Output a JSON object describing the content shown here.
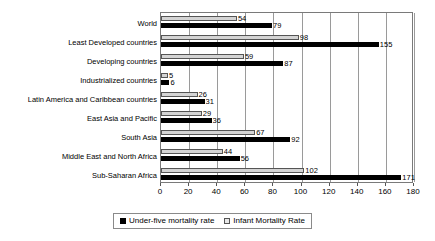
{
  "chart_data": {
    "type": "bar",
    "orientation": "horizontal",
    "title": "",
    "xlabel": "",
    "ylabel": "",
    "xlim": [
      0,
      180
    ],
    "xticks": [
      0,
      20,
      40,
      60,
      80,
      100,
      120,
      140,
      160,
      180
    ],
    "grid": true,
    "legend_position": "bottom",
    "categories": [
      "World",
      "Least Developed countries",
      "Developing countries",
      "Industrialized countries",
      "Latin America and Caribbean countries",
      "East Asia and Pacific",
      "South Asia",
      "Middle East and North Africa",
      "Sub-Saharan Africa"
    ],
    "series": [
      {
        "name": "Infant Mortality Rate",
        "color": "#d4d4d4",
        "values": [
          54,
          98,
          59,
          5,
          26,
          29,
          67,
          44,
          102
        ]
      },
      {
        "name": "Under-five mortality rate",
        "color": "#000000",
        "values": [
          79,
          155,
          87,
          6,
          31,
          36,
          92,
          56,
          171
        ]
      }
    ]
  },
  "legend": {
    "items": [
      {
        "label": "Under-five mortality rate",
        "swatch": "black"
      },
      {
        "label": "Infant Mortality Rate",
        "swatch": "light"
      }
    ]
  }
}
